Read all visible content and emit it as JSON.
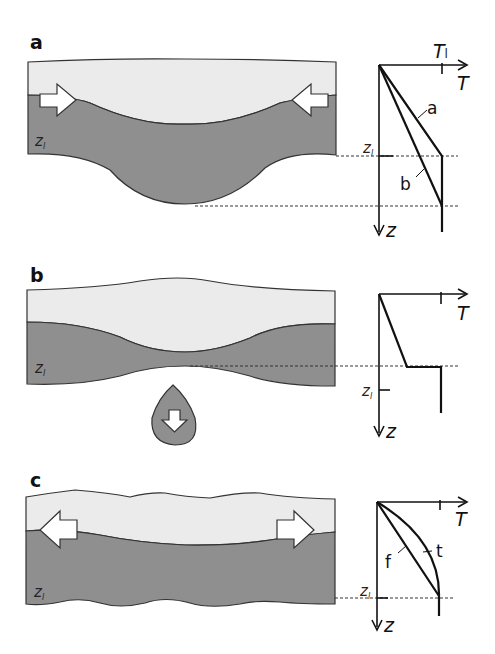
{
  "panels": [
    {
      "id": "a",
      "label": "a",
      "depth_label": "z",
      "depth_sub": "l",
      "arrows": "converging (compression)",
      "graph": {
        "x_axis": "T",
        "y_axis": "z",
        "tick_label": "T",
        "tick_sub": "l",
        "depth_label": "z",
        "depth_sub": "l",
        "curves": [
          {
            "name": "a",
            "label": "a"
          },
          {
            "name": "b",
            "label": "b"
          }
        ]
      }
    },
    {
      "id": "b",
      "label": "b",
      "depth_label": "z",
      "depth_sub": "l",
      "arrows": "detached drip sinking",
      "graph": {
        "x_axis": "T",
        "y_axis": "z",
        "depth_label": "z",
        "depth_sub": "l"
      }
    },
    {
      "id": "c",
      "label": "c",
      "depth_label": "z",
      "depth_sub": "l",
      "arrows": "diverging (extension)",
      "graph": {
        "x_axis": "T",
        "y_axis": "z",
        "depth_label": "z",
        "depth_sub": "l",
        "curves": [
          {
            "name": "f",
            "label": "f"
          },
          {
            "name": "t",
            "label": "t"
          }
        ]
      }
    }
  ],
  "colors": {
    "crust": "#ebebeb",
    "mantle_lithosphere": "#8f8f8f",
    "outline": "#333333",
    "arrow_fill": "#ffffff"
  }
}
